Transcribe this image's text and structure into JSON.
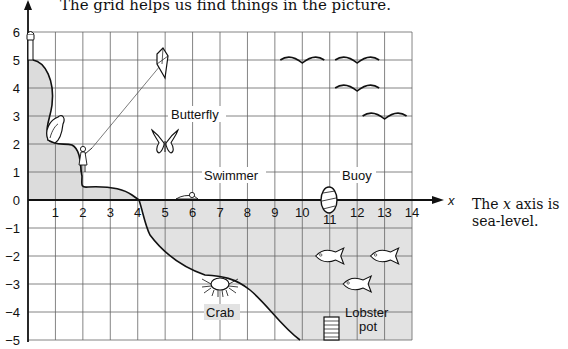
{
  "title": "The grid helps us find things in the picture.",
  "side_note": {
    "prefix": "The ",
    "italic": "x",
    "suffix": " axis is",
    "line2": "sea-level."
  },
  "axes": {
    "x_label": "x",
    "x_range": [
      0,
      14
    ],
    "y_range": [
      -5,
      6
    ],
    "x_ticks": [
      "1",
      "2",
      "3",
      "4",
      "5",
      "6",
      "7",
      "8",
      "9",
      "10",
      "11",
      "12",
      "13",
      "14"
    ],
    "y_ticks": [
      "6",
      "5",
      "4",
      "3",
      "2",
      "1",
      "0",
      "−1",
      "−2",
      "−3",
      "−4",
      "−5"
    ]
  },
  "labels": {
    "butterfly": "Butterfly",
    "swimmer": "Swimmer",
    "buoy": "Buoy",
    "crab": "Crab",
    "lobster_line1": "Lobster",
    "lobster_line2": "pot"
  },
  "objects": [
    {
      "name": "lighthouse",
      "x": 0,
      "y": 6
    },
    {
      "name": "bird",
      "x": 1,
      "y": 3
    },
    {
      "name": "girl",
      "x": 2,
      "y": 1
    },
    {
      "name": "kite",
      "x": 5,
      "y": 5
    },
    {
      "name": "butterfly",
      "x": 5,
      "y": 2
    },
    {
      "name": "swimmer",
      "x": 6,
      "y": 0
    },
    {
      "name": "buoy",
      "x": 11,
      "y": 0
    },
    {
      "name": "crab",
      "x": 7,
      "y": -3
    },
    {
      "name": "lobster-pot",
      "x": 11,
      "y": -5
    },
    {
      "name": "gulls",
      "points": [
        [
          10,
          5
        ],
        [
          12,
          5
        ],
        [
          12,
          4
        ],
        [
          13,
          3
        ]
      ]
    },
    {
      "name": "fish",
      "points": [
        [
          11,
          -2
        ],
        [
          13,
          -2
        ],
        [
          12,
          -3
        ]
      ]
    }
  ],
  "colors": {
    "land": "#dcdcdc",
    "sea": "#e4e4e4",
    "grid": "#555555",
    "ink": "#111111"
  }
}
